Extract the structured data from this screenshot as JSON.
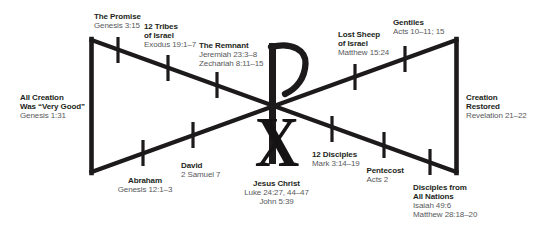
{
  "figure": {
    "background": "#ffffff",
    "line_color": "#1d1a1b",
    "title_color": "#231f20",
    "ref_color": "#58595b",
    "center_symbol": "chi-rho",
    "chi_letter": "X"
  },
  "nodes": [
    {
      "id": "all-creation",
      "title": [
        "All Creation",
        "Was “Very Good”"
      ],
      "refs": [
        "Genesis 1:31"
      ]
    },
    {
      "id": "the-promise",
      "title": [
        "The Promise"
      ],
      "refs": [
        "Genesis 3:15"
      ]
    },
    {
      "id": "twelve-tribes",
      "title": [
        "12 Tribes",
        "of Israel"
      ],
      "refs": [
        "Exodus 19:1–7"
      ]
    },
    {
      "id": "the-remnant",
      "title": [
        "The Remnant"
      ],
      "refs": [
        "Jeremiah 23:3–8",
        "Zechariah 8:11–15"
      ]
    },
    {
      "id": "lost-sheep",
      "title": [
        "Lost Sheep",
        "of Israel"
      ],
      "refs": [
        "Matthew 15:24"
      ]
    },
    {
      "id": "gentiles",
      "title": [
        "Gentiles"
      ],
      "refs": [
        "Acts 10–11; 15"
      ]
    },
    {
      "id": "creation-restored",
      "title": [
        "Creation",
        "Restored"
      ],
      "refs": [
        "Revelation 21–22"
      ]
    },
    {
      "id": "abraham",
      "title": [
        "Abraham"
      ],
      "refs": [
        "Genesis 12:1–3"
      ]
    },
    {
      "id": "david",
      "title": [
        "David"
      ],
      "refs": [
        "2 Samuel 7"
      ]
    },
    {
      "id": "jesus-christ",
      "title": [
        "Jesus Christ"
      ],
      "refs": [
        "Luke 24:27, 44–47",
        "John 5:39"
      ]
    },
    {
      "id": "twelve-disciples",
      "title": [
        "12 Disciples"
      ],
      "refs": [
        "Mark 3:14–19"
      ]
    },
    {
      "id": "pentecost",
      "title": [
        "Pentecost"
      ],
      "refs": [
        "Acts 2"
      ]
    },
    {
      "id": "disciples-all-nations",
      "title": [
        "Disciples from",
        "All Nations"
      ],
      "refs": [
        "Isaiah 49:6",
        "Matthew 28:18–20"
      ]
    }
  ]
}
